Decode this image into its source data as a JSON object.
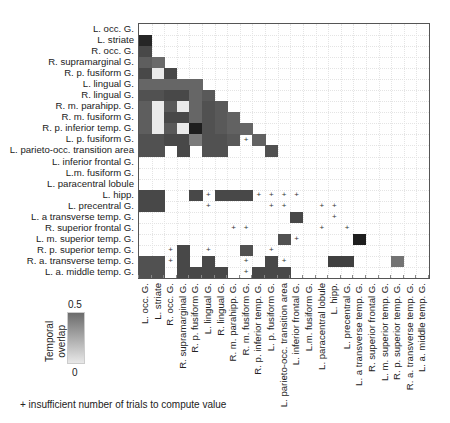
{
  "chart_data": {
    "type": "heatmap",
    "title": "",
    "colorbar": {
      "label": "Temporal overlap",
      "min_label": "0",
      "max_label": "0.5",
      "range": [
        0,
        0.5
      ]
    },
    "footnote": "+ insufficient number of trials to compute value",
    "labels": [
      "L. occ. G.",
      "L. striate",
      "R. occ. G.",
      "R. supramarginal G.",
      "R. p. fusiform G.",
      "L. lingual G.",
      "R. lingual G.",
      "R. m. parahipp. G.",
      "R. m. fusiform G.",
      "R. p. inferior temp. G.",
      "L. p. fusiform G.",
      "L. parieto-occ. transition area",
      "L. inferior frontal G.",
      "L.m. fusiform G.",
      "L. paracentral lobule",
      "L. hipp.",
      "L. precentral G.",
      "L. a transverse temp. G.",
      "R. superior frontal G.",
      "L. m. superior temp. G.",
      "R. p. superior temp. G.",
      "R. a. transverse temp. G.",
      "L. a. middle temp. G."
    ],
    "cells": [
      {
        "r": 1,
        "c": 0,
        "v": 0.48
      },
      {
        "r": 2,
        "c": 0,
        "v": 0.4
      },
      {
        "r": 3,
        "c": 0,
        "v": 0.35
      },
      {
        "r": 3,
        "c": 1,
        "v": 0.32
      },
      {
        "r": 4,
        "c": 0,
        "v": 0.4
      },
      {
        "r": 4,
        "c": 1,
        "v": 0.02
      },
      {
        "r": 4,
        "c": 2,
        "v": 0.4
      },
      {
        "r": 5,
        "c": 0,
        "v": 0.33
      },
      {
        "r": 5,
        "c": 1,
        "v": 0.33
      },
      {
        "r": 5,
        "c": 2,
        "v": 0.33
      },
      {
        "r": 5,
        "c": 3,
        "v": 0.33
      },
      {
        "r": 5,
        "c": 4,
        "v": 0.33
      },
      {
        "r": 6,
        "c": 0,
        "v": 0.38
      },
      {
        "r": 6,
        "c": 1,
        "v": 0.38
      },
      {
        "r": 6,
        "c": 2,
        "v": 0.4
      },
      {
        "r": 6,
        "c": 3,
        "v": 0.4
      },
      {
        "r": 6,
        "c": 4,
        "v": 0.33
      },
      {
        "r": 6,
        "c": 5,
        "v": 0.36
      },
      {
        "r": 7,
        "c": 0,
        "v": 0.35
      },
      {
        "r": 7,
        "c": 1,
        "v": 0.02
      },
      {
        "r": 7,
        "c": 2,
        "v": 0.36
      },
      {
        "r": 7,
        "c": 3,
        "v": 0.02
      },
      {
        "r": 7,
        "c": 4,
        "v": 0.33
      },
      {
        "r": 7,
        "c": 5,
        "v": 0.38
      },
      {
        "r": 7,
        "c": 6,
        "v": 0.36
      },
      {
        "r": 8,
        "c": 0,
        "v": 0.35
      },
      {
        "r": 8,
        "c": 1,
        "v": 0.02
      },
      {
        "r": 8,
        "c": 2,
        "v": 0.4
      },
      {
        "r": 8,
        "c": 3,
        "v": 0.4
      },
      {
        "r": 8,
        "c": 4,
        "v": 0.33
      },
      {
        "r": 8,
        "c": 5,
        "v": 0.38
      },
      {
        "r": 8,
        "c": 6,
        "v": 0.36
      },
      {
        "r": 8,
        "c": 7,
        "v": 0.34
      },
      {
        "r": 9,
        "c": 0,
        "v": 0.35
      },
      {
        "r": 9,
        "c": 1,
        "v": 0.02
      },
      {
        "r": 9,
        "c": 2,
        "v": 0.36
      },
      {
        "r": 9,
        "c": 3,
        "v": 0.02
      },
      {
        "r": 9,
        "c": 4,
        "v": 0.5
      },
      {
        "r": 9,
        "c": 5,
        "v": 0.38
      },
      {
        "r": 9,
        "c": 6,
        "v": 0.36
      },
      {
        "r": 9,
        "c": 7,
        "v": 0.34
      },
      {
        "r": 9,
        "c": 8,
        "v": 0.33
      },
      {
        "r": 10,
        "c": 0,
        "v": 0.38
      },
      {
        "r": 10,
        "c": 1,
        "v": 0.38
      },
      {
        "r": 10,
        "c": 2,
        "v": 0.4
      },
      {
        "r": 10,
        "c": 3,
        "v": 0.4
      },
      {
        "r": 10,
        "c": 4,
        "v": 0.28
      },
      {
        "r": 10,
        "c": 5,
        "v": 0.38
      },
      {
        "r": 10,
        "c": 6,
        "v": 0.38
      },
      {
        "r": 10,
        "c": 7,
        "v": 0.36
      },
      {
        "r": 10,
        "c": 8,
        "p": true
      },
      {
        "r": 10,
        "c": 9,
        "v": 0.34
      },
      {
        "r": 11,
        "c": 0,
        "v": 0.38
      },
      {
        "r": 11,
        "c": 1,
        "v": 0.38
      },
      {
        "r": 11,
        "c": 3,
        "v": 0.4
      },
      {
        "r": 11,
        "c": 5,
        "v": 0.38
      },
      {
        "r": 11,
        "c": 6,
        "v": 0.38
      },
      {
        "r": 11,
        "c": 10,
        "v": 0.38
      },
      {
        "r": 15,
        "c": 0,
        "v": 0.4
      },
      {
        "r": 15,
        "c": 1,
        "v": 0.4
      },
      {
        "r": 15,
        "c": 4,
        "v": 0.4
      },
      {
        "r": 15,
        "c": 5,
        "p": true
      },
      {
        "r": 15,
        "c": 6,
        "v": 0.4
      },
      {
        "r": 15,
        "c": 7,
        "v": 0.4
      },
      {
        "r": 15,
        "c": 8,
        "v": 0.4
      },
      {
        "r": 15,
        "c": 9,
        "p": true
      },
      {
        "r": 15,
        "c": 10,
        "p": true
      },
      {
        "r": 15,
        "c": 11,
        "p": true
      },
      {
        "r": 15,
        "c": 12,
        "p": true
      },
      {
        "r": 16,
        "c": 0,
        "v": 0.4
      },
      {
        "r": 16,
        "c": 1,
        "v": 0.4
      },
      {
        "r": 16,
        "c": 5,
        "p": true
      },
      {
        "r": 16,
        "c": 10,
        "p": true
      },
      {
        "r": 16,
        "c": 11,
        "p": true
      },
      {
        "r": 16,
        "c": 14,
        "p": true
      },
      {
        "r": 16,
        "c": 15,
        "p": true
      },
      {
        "r": 17,
        "c": 12,
        "v": 0.4
      },
      {
        "r": 17,
        "c": 15,
        "p": true
      },
      {
        "r": 18,
        "c": 7,
        "p": true
      },
      {
        "r": 18,
        "c": 8,
        "p": true
      },
      {
        "r": 18,
        "c": 14,
        "p": true
      },
      {
        "r": 18,
        "c": 16,
        "p": true
      },
      {
        "r": 19,
        "c": 11,
        "v": 0.38
      },
      {
        "r": 19,
        "c": 12,
        "p": true
      },
      {
        "r": 19,
        "c": 17,
        "v": 0.5
      },
      {
        "r": 20,
        "c": 2,
        "p": true
      },
      {
        "r": 20,
        "c": 3,
        "v": 0.4
      },
      {
        "r": 20,
        "c": 5,
        "p": true
      },
      {
        "r": 20,
        "c": 8,
        "v": 0.38
      },
      {
        "r": 20,
        "c": 10,
        "p": true
      },
      {
        "r": 21,
        "c": 0,
        "v": 0.38
      },
      {
        "r": 21,
        "c": 1,
        "v": 0.38
      },
      {
        "r": 21,
        "c": 2,
        "p": true
      },
      {
        "r": 21,
        "c": 3,
        "v": 0.4
      },
      {
        "r": 21,
        "c": 5,
        "v": 0.4
      },
      {
        "r": 21,
        "c": 8,
        "p": true
      },
      {
        "r": 21,
        "c": 10,
        "v": 0.4
      },
      {
        "r": 21,
        "c": 11,
        "p": true
      },
      {
        "r": 21,
        "c": 15,
        "v": 0.42
      },
      {
        "r": 21,
        "c": 16,
        "v": 0.42
      },
      {
        "r": 21,
        "c": 20,
        "v": 0.3
      },
      {
        "r": 22,
        "c": 0,
        "v": 0.38
      },
      {
        "r": 22,
        "c": 1,
        "v": 0.38
      },
      {
        "r": 22,
        "c": 3,
        "v": 0.4
      },
      {
        "r": 22,
        "c": 4,
        "v": 0.4
      },
      {
        "r": 22,
        "c": 5,
        "v": 0.4
      },
      {
        "r": 22,
        "c": 6,
        "v": 0.4
      },
      {
        "r": 22,
        "c": 8,
        "p": true
      },
      {
        "r": 22,
        "c": 9,
        "v": 0.4
      },
      {
        "r": 22,
        "c": 10,
        "v": 0.4
      },
      {
        "r": 22,
        "c": 11,
        "v": 0.4
      }
    ],
    "grid": {
      "left": 138,
      "top": 23,
      "width": 290,
      "height": 254
    }
  },
  "legend": {
    "title_line1": "Temporal",
    "title_line2": "overlap",
    "max": "0.5",
    "min": "0"
  },
  "footnote": "+ insufficient number of trials to compute value",
  "plus_symbol": "+"
}
